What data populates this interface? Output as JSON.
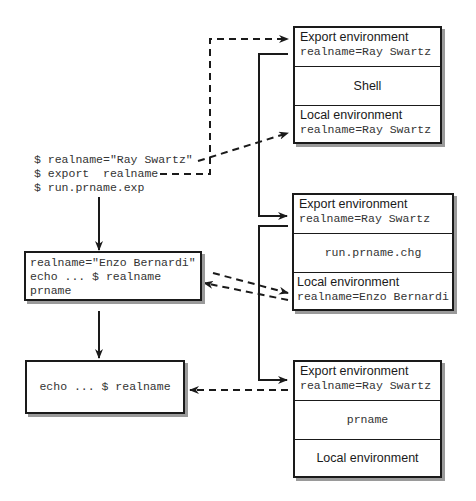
{
  "commands": {
    "lines": [
      "$ realname=\"Ray Swartz\"",
      "$ export  realname",
      "$ run.prname.exp"
    ]
  },
  "script_box": {
    "lines": [
      "realname=\"Enzo Bernardi\"",
      "echo ... $ realname",
      "prname"
    ]
  },
  "echo_box": {
    "text": "echo ... $ realname"
  },
  "process_boxes": [
    {
      "export_label": "Export environment",
      "export_value": "realname=Ray Swartz",
      "program": "Shell",
      "local_label": "Local environment",
      "local_value": "realname=Ray Swartz"
    },
    {
      "export_label": "Export environment",
      "export_value": "realname=Ray Swartz",
      "program": "run.prname.chg",
      "local_label": "Local environment",
      "local_value": "realname=Enzo Bernardi"
    },
    {
      "export_label": "Export environment",
      "export_value": "realname=Ray Swartz",
      "program": "prname",
      "local_label": "Local environment",
      "local_value": ""
    }
  ]
}
